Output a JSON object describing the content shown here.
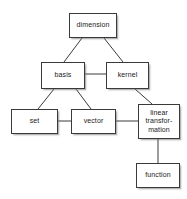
{
  "diagram": {
    "type": "concept-map",
    "background_color": "#ffffff",
    "node_fill_color": "#ffffff",
    "node_border_color": "#3a3a3a",
    "text_color": "#1a1a1a",
    "edge_color": "#3a3a3a",
    "nodes": [
      {
        "id": "dimension",
        "label": "dimension",
        "x": 69,
        "y": 13,
        "w": 48,
        "h": 25
      },
      {
        "id": "basis",
        "label": "basis",
        "x": 41,
        "y": 62,
        "w": 44,
        "h": 27
      },
      {
        "id": "kernel",
        "label": "kernel",
        "x": 106,
        "y": 62,
        "w": 43,
        "h": 27
      },
      {
        "id": "set",
        "label": "set",
        "x": 11,
        "y": 109,
        "w": 47,
        "h": 25
      },
      {
        "id": "vector",
        "label": "vector",
        "x": 71,
        "y": 109,
        "w": 45,
        "h": 25
      },
      {
        "id": "linear-transformation",
        "label": "linear\ntransfor-\nmation",
        "x": 138,
        "y": 104,
        "w": 42,
        "h": 35
      },
      {
        "id": "function",
        "label": "function",
        "x": 136,
        "y": 163,
        "w": 44,
        "h": 25
      }
    ],
    "edges": [
      {
        "from": "dimension",
        "to": "basis",
        "x1": 82,
        "y1": 38,
        "x2": 64,
        "y2": 62
      },
      {
        "from": "dimension",
        "to": "kernel",
        "x1": 104,
        "y1": 38,
        "x2": 123,
        "y2": 62
      },
      {
        "from": "basis",
        "to": "kernel",
        "x1": 85,
        "y1": 74,
        "x2": 106,
        "y2": 74
      },
      {
        "from": "basis",
        "to": "set",
        "x1": 54,
        "y1": 89,
        "x2": 38,
        "y2": 109
      },
      {
        "from": "basis",
        "to": "vector",
        "x1": 76,
        "y1": 89,
        "x2": 91,
        "y2": 109
      },
      {
        "from": "kernel",
        "to": "linear-transformation",
        "x1": 135,
        "y1": 89,
        "x2": 152,
        "y2": 104
      },
      {
        "from": "set",
        "to": "vector",
        "x1": 58,
        "y1": 121,
        "x2": 71,
        "y2": 121
      },
      {
        "from": "vector",
        "to": "linear-transformation",
        "x1": 116,
        "y1": 121,
        "x2": 138,
        "y2": 121
      },
      {
        "from": "linear-transformation",
        "to": "function",
        "x1": 158,
        "y1": 139,
        "x2": 158,
        "y2": 163
      }
    ]
  }
}
